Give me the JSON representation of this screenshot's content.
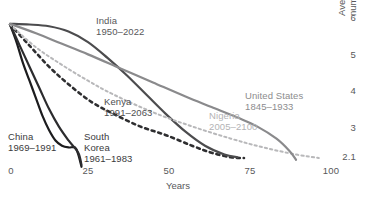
{
  "chart_data": {
    "type": "line",
    "title": "",
    "xlabel": "Years",
    "ylabel": "Average fertility per woman, number of children",
    "xlim": [
      0,
      100
    ],
    "ylim": [
      2.1,
      6
    ],
    "grid": false,
    "legend_position": "inline-annotations",
    "x_ticks": [
      "0",
      "25",
      "50",
      "75",
      "100"
    ],
    "y_ticks": [
      "6",
      "5",
      "4",
      "3",
      "2.1"
    ],
    "y_axis_side": "right",
    "series": [
      {
        "name": "China",
        "period": "1969–1991",
        "label": "China",
        "label_line2": "1969–1991",
        "color": "#1c1c1e",
        "style": "solid",
        "width": 2.2,
        "x": [
          0,
          2,
          4,
          6,
          8,
          10,
          12,
          14,
          16,
          18,
          20,
          21,
          22
        ],
        "y": [
          5.9,
          5.4,
          4.8,
          4.3,
          3.8,
          3.3,
          2.9,
          2.6,
          2.45,
          2.4,
          2.4,
          2.2,
          1.85
        ]
      },
      {
        "name": "South Korea",
        "period": "1961–1983",
        "label": "South",
        "label_line2": "Korea",
        "label_line3": "1961–1983",
        "color": "#2c2c2e",
        "style": "solid",
        "width": 2.2,
        "x": [
          0,
          3,
          6,
          9,
          12,
          15,
          18,
          21,
          22
        ],
        "y": [
          5.9,
          5.3,
          4.7,
          4.1,
          3.5,
          3.0,
          2.6,
          2.25,
          1.9
        ]
      },
      {
        "name": "Kenya",
        "period": "1991–2063",
        "label": "Kenya",
        "label_line2": "1991–2063",
        "color": "#2e2e30",
        "style": "dashed",
        "width": 2.6,
        "x": [
          0,
          6,
          12,
          18,
          25,
          32,
          40,
          48,
          56,
          62,
          68,
          72
        ],
        "y": [
          5.9,
          5.3,
          4.7,
          4.2,
          3.7,
          3.35,
          3.0,
          2.75,
          2.45,
          2.25,
          2.12,
          2.1
        ]
      },
      {
        "name": "India",
        "period": "1950–2022",
        "label": "India",
        "label_line2": "1950–2022",
        "color": "#4c4c4e",
        "style": "solid",
        "width": 2.2,
        "x": [
          0,
          6,
          12,
          18,
          24,
          30,
          36,
          42,
          48,
          54,
          60,
          66,
          70
        ],
        "y": [
          5.92,
          5.9,
          5.85,
          5.7,
          5.4,
          4.95,
          4.45,
          3.9,
          3.35,
          2.85,
          2.45,
          2.2,
          2.12
        ]
      },
      {
        "name": "Nigeria",
        "period": "2005–2100",
        "label": "Nigeria",
        "label_line2": "2005–2100",
        "color": "#b8b8ba",
        "style": "dashed",
        "width": 2.0,
        "x": [
          0,
          8,
          16,
          24,
          32,
          44,
          56,
          68,
          78,
          88,
          95
        ],
        "y": [
          5.9,
          5.25,
          4.75,
          4.3,
          3.9,
          3.4,
          3.0,
          2.65,
          2.4,
          2.2,
          2.1
        ]
      },
      {
        "name": "United States",
        "period": "1845–1933",
        "label": "United States",
        "label_line2": "1845–1933",
        "color": "#8a8a8c",
        "style": "solid",
        "width": 2.2,
        "x": [
          0,
          8,
          16,
          24,
          34,
          44,
          54,
          62,
          70,
          76,
          82,
          86,
          88
        ],
        "y": [
          5.92,
          5.65,
          5.35,
          5.05,
          4.65,
          4.25,
          3.85,
          3.55,
          3.25,
          3.0,
          2.65,
          2.3,
          2.05
        ]
      }
    ]
  },
  "axis": {
    "x_title": "Years",
    "y_title_line1": "Average fertility per woman,",
    "y_title_line2": "number of children",
    "x_tick_0": "0",
    "x_tick_25": "25",
    "x_tick_50": "50",
    "x_tick_75": "75",
    "x_tick_100": "100",
    "y_tick_6": "6",
    "y_tick_5": "5",
    "y_tick_4": "4",
    "y_tick_3": "3",
    "y_tick_21": "2.1"
  },
  "labels": {
    "china_l1": "China",
    "china_l2": "1969–1991",
    "korea_l1": "South",
    "korea_l2": "Korea",
    "korea_l3": "1961–1983",
    "kenya_l1": "Kenya",
    "kenya_l2": "1991–2063",
    "india_l1": "India",
    "india_l2": "1950–2022",
    "nigeria_l1": "Nigeria",
    "nigeria_l2": "2005–2100",
    "us_l1": "United States",
    "us_l2": "1845–1933"
  }
}
